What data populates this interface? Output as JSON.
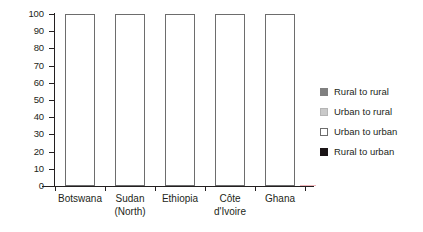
{
  "chart_data": {
    "type": "bar",
    "stacked": true,
    "title": "",
    "subtitle": "",
    "xlabel": "",
    "ylabel": "",
    "ylim": [
      0,
      100
    ],
    "yticks": [
      0,
      10,
      20,
      30,
      40,
      50,
      60,
      70,
      80,
      90,
      100
    ],
    "ytick_labels": [
      "0",
      "10",
      "20",
      "30",
      "40",
      "50",
      "60",
      "70",
      "80",
      "90",
      "100"
    ],
    "grid": false,
    "legend_position": "right",
    "categories": [
      "Botswana",
      "Sudan (North)",
      "Ethiopia",
      "Côte d'Ivoire",
      "Ghana"
    ],
    "category_lines": [
      [
        "Botswana"
      ],
      [
        "Sudan",
        "(North)"
      ],
      [
        "Ethiopia"
      ],
      [
        "Côte",
        "d'Ivoire"
      ],
      [
        "Ghana"
      ]
    ],
    "series": [
      {
        "name": "Rural to urban",
        "color": "#1a1416",
        "values": [
          61,
          35,
          30,
          15,
          5
        ]
      },
      {
        "name": "Urban to urban",
        "color": "#ffffff",
        "values": [
          8,
          41,
          13,
          45,
          49
        ]
      },
      {
        "name": "Urban to rural",
        "color": "#c9c9c9",
        "values": [
          2,
          6,
          2,
          22,
          34
        ]
      },
      {
        "name": "Rural to rural",
        "color": "#808080",
        "values": [
          29,
          18,
          55,
          18,
          12
        ]
      }
    ],
    "legend_entries": [
      {
        "label": "Rural to rural",
        "color": "#808080",
        "key": "rural-rural"
      },
      {
        "label": "Urban to rural",
        "color": "#c9c9c9",
        "key": "urban-rural"
      },
      {
        "label": "Urban to urban",
        "color": "#ffffff",
        "key": "urban-urban"
      },
      {
        "label": "Rural to urban",
        "color": "#1a1416",
        "key": "rural-urban"
      }
    ],
    "axis_color": "#231f20",
    "background": "#ffffff"
  }
}
